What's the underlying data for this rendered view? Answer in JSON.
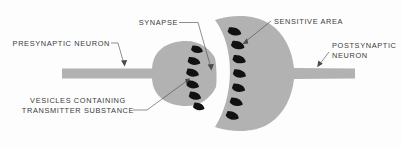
{
  "figure": {
    "title": "Synapse structure diagram",
    "background_color": "#fdfdfd",
    "cell_color": "#b2b2b2",
    "vesicle_color": "#111111",
    "cleft_color": "#fdfdfd",
    "label_color": "#3b3b3b"
  },
  "labels": {
    "synapse": "SYNAPSE",
    "sensitive_area": "SENSITIVE  AREA",
    "presynaptic_neuron": "PRESYNAPTIC  NEURON",
    "postsynaptic_neuron_line1": "POSTSYNAPTIC",
    "postsynaptic_neuron_line2": "NEURON",
    "vesicles_line1": "VESICLES  CONTAINING",
    "vesicles_line2": "TRANSMITTER  SUBSTANCE"
  },
  "structures": {
    "presynaptic_vesicle_count": 6,
    "postsynaptic_receptor_count": 7,
    "presynaptic_terminal": "presynaptic terminal bulb",
    "postsynaptic_cell": "postsynaptic crescent cell",
    "synaptic_cleft": "synaptic cleft"
  }
}
